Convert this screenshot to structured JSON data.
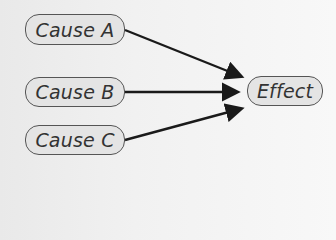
{
  "diagram": {
    "type": "cause-effect",
    "causes": [
      {
        "label": "Cause A"
      },
      {
        "label": "Cause B"
      },
      {
        "label": "Cause C"
      }
    ],
    "effect": {
      "label": "Effect"
    },
    "colors": {
      "node_fill": "#e4e4e4",
      "node_border": "#555555",
      "arrow": "#1a1a1a",
      "text": "#333333"
    }
  }
}
